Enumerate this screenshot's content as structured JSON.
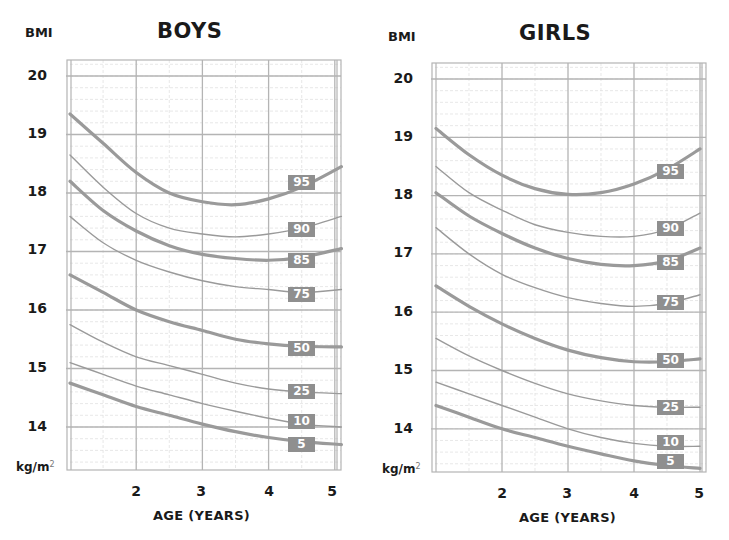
{
  "chart_data": [
    {
      "type": "line",
      "title": "BOYS",
      "ylabel": "BMI",
      "yunit": "kg/m²",
      "xlabel": "AGE (YEARS)",
      "x_ticks": [
        "2",
        "3",
        "4",
        "5"
      ],
      "y_ticks": [
        "20",
        "19",
        "18",
        "17",
        "16",
        "15",
        "14"
      ],
      "xlim": [
        1,
        5.1
      ],
      "ylim": [
        13.3,
        20.25
      ],
      "grid": true,
      "legend_position": "inline labels at right end of curves (x≈4.6)",
      "x": [
        1,
        1.5,
        2,
        2.5,
        3,
        3.5,
        4,
        4.5,
        5.1
      ],
      "series": [
        {
          "name": "95",
          "label": "95",
          "bold": true,
          "values": [
            19.35,
            18.85,
            18.35,
            18.0,
            17.85,
            17.8,
            17.9,
            18.1,
            18.45
          ]
        },
        {
          "name": "90",
          "label": "90",
          "bold": false,
          "values": [
            18.65,
            18.1,
            17.65,
            17.4,
            17.3,
            17.25,
            17.3,
            17.4,
            17.6
          ]
        },
        {
          "name": "85",
          "label": "85",
          "bold": true,
          "values": [
            18.2,
            17.7,
            17.35,
            17.1,
            16.95,
            16.88,
            16.85,
            16.9,
            17.05
          ]
        },
        {
          "name": "75",
          "label": "75",
          "bold": false,
          "values": [
            17.6,
            17.15,
            16.85,
            16.65,
            16.5,
            16.4,
            16.35,
            16.3,
            16.35
          ]
        },
        {
          "name": "50",
          "label": "50",
          "bold": true,
          "values": [
            16.6,
            16.3,
            16.0,
            15.8,
            15.65,
            15.5,
            15.42,
            15.38,
            15.37
          ]
        },
        {
          "name": "25",
          "label": "25",
          "bold": false,
          "values": [
            15.75,
            15.45,
            15.2,
            15.05,
            14.9,
            14.75,
            14.65,
            14.6,
            14.57
          ]
        },
        {
          "name": "10",
          "label": "10",
          "bold": false,
          "values": [
            15.1,
            14.9,
            14.7,
            14.55,
            14.4,
            14.27,
            14.15,
            14.05,
            14.0
          ]
        },
        {
          "name": "5",
          "label": "5",
          "bold": true,
          "values": [
            14.75,
            14.55,
            14.35,
            14.2,
            14.05,
            13.92,
            13.82,
            13.75,
            13.7
          ]
        }
      ]
    },
    {
      "type": "line",
      "title": "GIRLS",
      "ylabel": "BMI",
      "yunit": "kg/m²",
      "xlabel": "AGE (YEARS)",
      "x_ticks": [
        "2",
        "3",
        "4",
        "5"
      ],
      "y_ticks": [
        "20",
        "19",
        "18",
        "17",
        "16",
        "15",
        "14"
      ],
      "xlim": [
        1,
        5.1
      ],
      "ylim": [
        13.25,
        20.3
      ],
      "grid": true,
      "legend_position": "inline labels at right end of curves (x≈4.55)",
      "x": [
        1,
        1.5,
        2,
        2.5,
        3,
        3.5,
        4,
        4.5,
        5.0
      ],
      "series": [
        {
          "name": "95",
          "label": "95",
          "bold": true,
          "values": [
            19.15,
            18.7,
            18.35,
            18.12,
            18.02,
            18.05,
            18.2,
            18.45,
            18.8
          ]
        },
        {
          "name": "90",
          "label": "90",
          "bold": false,
          "values": [
            18.5,
            18.05,
            17.75,
            17.5,
            17.37,
            17.3,
            17.3,
            17.42,
            17.7
          ]
        },
        {
          "name": "85",
          "label": "85",
          "bold": true,
          "values": [
            18.05,
            17.65,
            17.35,
            17.1,
            16.92,
            16.82,
            16.8,
            16.88,
            17.1
          ]
        },
        {
          "name": "75",
          "label": "75",
          "bold": false,
          "values": [
            17.45,
            17.0,
            16.65,
            16.42,
            16.25,
            16.15,
            16.1,
            16.15,
            16.3
          ]
        },
        {
          "name": "50",
          "label": "50",
          "bold": true,
          "values": [
            16.45,
            16.1,
            15.8,
            15.55,
            15.35,
            15.22,
            15.15,
            15.15,
            15.2
          ]
        },
        {
          "name": "25",
          "label": "25",
          "bold": false,
          "values": [
            15.55,
            15.25,
            15.0,
            14.78,
            14.6,
            14.48,
            14.4,
            14.37,
            14.37
          ]
        },
        {
          "name": "10",
          "label": "10",
          "bold": false,
          "values": [
            14.8,
            14.6,
            14.4,
            14.2,
            14.0,
            13.85,
            13.75,
            13.7,
            13.7
          ]
        },
        {
          "name": "5",
          "label": "5",
          "bold": true,
          "values": [
            14.4,
            14.2,
            14.0,
            13.85,
            13.7,
            13.57,
            13.45,
            13.37,
            13.32
          ]
        }
      ]
    }
  ],
  "boys": {
    "bmi_label": "BMI",
    "title": "BOYS",
    "unit": "kg/m",
    "unit_sup": "2",
    "y_ticks": [
      "20",
      "19",
      "18",
      "17",
      "16",
      "15",
      "14"
    ],
    "x_ticks": [
      "2",
      "3",
      "4",
      "5"
    ],
    "xlabel": "AGE (YEARS)",
    "labels": [
      "95",
      "90",
      "85",
      "75",
      "50",
      "25",
      "10",
      "5"
    ]
  },
  "girls": {
    "bmi_label": "BMI",
    "title": "GIRLS",
    "unit": "kg/m",
    "unit_sup": "2",
    "y_ticks": [
      "20",
      "19",
      "18",
      "17",
      "16",
      "15",
      "14"
    ],
    "x_ticks": [
      "2",
      "3",
      "4",
      "5"
    ],
    "xlabel": "AGE (YEARS)",
    "labels": [
      "95",
      "90",
      "85",
      "75",
      "50",
      "25",
      "10",
      "5"
    ]
  },
  "colors": {
    "grid": "#b4b4b4",
    "grid_minor": "#dedede",
    "curve": "#9a9a9a",
    "label_bg": "#8f8f8f",
    "label_text": "#ffffff",
    "text": "#1a1a1a"
  }
}
